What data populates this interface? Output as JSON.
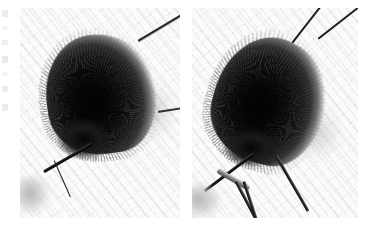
{
  "figure": {
    "name": "two-panel-macro-photograph",
    "background_color": "#ffffff",
    "panel_background_color": "#fbfbfb",
    "specimen_color": "#050505",
    "wire_color": "#1d1d1d",
    "metal_color": "#8d8d8d",
    "width_px": 372,
    "height_px": 226,
    "panels": [
      {
        "id": "panel-left",
        "label": "",
        "x": 20,
        "y": 8,
        "width": 160,
        "height": 210,
        "description": "dark fuzzy teardrop specimen suspended on a thin wire, angled lower-left",
        "elements": [
          {
            "name": "specimen",
            "label": ""
          },
          {
            "name": "suspension-wire-upper-right",
            "label": ""
          },
          {
            "name": "mounting-stem-lower-left",
            "label": ""
          },
          {
            "name": "wire-fragment-right-edge",
            "label": ""
          },
          {
            "name": "out-of-focus-object-lower-left",
            "label": ""
          }
        ]
      },
      {
        "id": "panel-right",
        "label": "",
        "x": 192,
        "y": 8,
        "width": 166,
        "height": 210,
        "description": "same specimen held upright by forceps, two suspension wires at top, bright highlight upper-left of specimen",
        "elements": [
          {
            "name": "specimen",
            "label": ""
          },
          {
            "name": "suspension-wire-left",
            "label": ""
          },
          {
            "name": "suspension-wire-right",
            "label": ""
          },
          {
            "name": "mounting-stem-lower-left",
            "label": ""
          },
          {
            "name": "forceps",
            "label": ""
          },
          {
            "name": "specular-highlight",
            "label": ""
          },
          {
            "name": "out-of-focus-object-lower-left",
            "label": ""
          }
        ]
      }
    ],
    "margin_marks": {
      "name": "cropped-margin-marks",
      "count": 7,
      "label": ""
    }
  }
}
